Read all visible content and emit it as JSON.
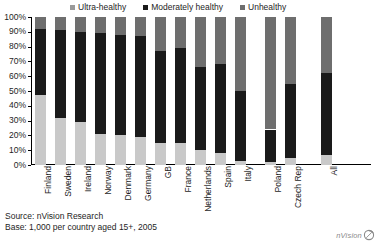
{
  "chart_data": {
    "type": "bar",
    "subtype": "stacked-bar-100",
    "title": "",
    "xlabel": "",
    "ylabel": "",
    "ylim": [
      0,
      100
    ],
    "ytick_labels": [
      "0%",
      "10%",
      "20%",
      "30%",
      "40%",
      "50%",
      "60%",
      "70%",
      "80%",
      "90%",
      "100%"
    ],
    "ytick_values": [
      0,
      10,
      20,
      30,
      40,
      50,
      60,
      70,
      80,
      90,
      100
    ],
    "grid": false,
    "legend_position": "top",
    "categories": [
      "Finland",
      "Sweden",
      "Ireland",
      "Norway",
      "Denmark",
      "Germany",
      "GB",
      "France",
      "Netherlands",
      "Spain",
      "Italy",
      "Poland",
      "Czech Rep",
      "All"
    ],
    "series": [
      {
        "name": "Ultra-healthy",
        "color": "#c9c9c9",
        "values": [
          47,
          32,
          29,
          21,
          20,
          19,
          15,
          15,
          10,
          8,
          3,
          2,
          5,
          7
        ]
      },
      {
        "name": "Moderately healthy",
        "color": "#1a1a1a",
        "values": [
          45,
          59,
          61,
          68,
          68,
          68,
          62,
          64,
          56,
          60,
          47,
          22,
          50,
          55
        ]
      },
      {
        "name": "Unhealthy",
        "color": "#6e6e6e",
        "values": [
          8,
          9,
          10,
          11,
          12,
          13,
          23,
          21,
          34,
          32,
          50,
          76,
          45,
          38
        ]
      }
    ]
  },
  "legend": {
    "items": [
      {
        "label": "Ultra-healthy",
        "color": "#9a9a9a"
      },
      {
        "label": "Moderately healthy",
        "color": "#1a1a1a"
      },
      {
        "label": "Unhealthy",
        "color": "#6e6e6e"
      }
    ]
  },
  "footer": {
    "source": "Source: nVision Research",
    "base": "Base: 1,000 per country aged 15+, 2005"
  },
  "logo": {
    "text": "nVision"
  }
}
